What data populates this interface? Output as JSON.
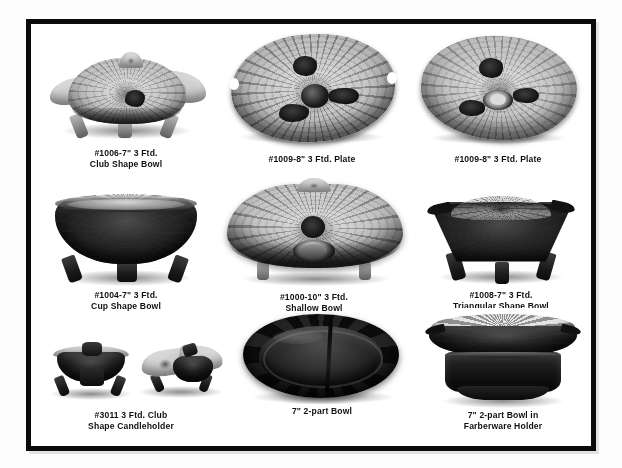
{
  "page": {
    "background_color": "#ffffff",
    "border_color": "#0b0b0b",
    "media": "grayscale-photograph-catalog-page"
  },
  "items": [
    {
      "id": "item-1006",
      "row": 1,
      "col": 1,
      "caption_line_1": "#1006-7\" 3 Ftd.",
      "caption_line_2": "Club Shape Bowl",
      "photo_description": "clear leaf-pattern three-footed club shape bowl, light gray glass",
      "tone": "light",
      "shape": "club"
    },
    {
      "id": "item-1009-a",
      "row": 1,
      "col": 2,
      "caption_line_1": "#1009-8\" 3 Ftd. Plate",
      "caption_line_2": "",
      "photo_description": "leaf-veined round plate viewed from above with dark center hub",
      "tone": "light",
      "shape": "plate"
    },
    {
      "id": "item-1009-b",
      "row": 1,
      "col": 3,
      "caption_line_1": "#1009-8\" 3 Ftd. Plate",
      "caption_line_2": "",
      "photo_description": "leaf-veined round plate viewed from above with ring foot at center",
      "tone": "light",
      "shape": "plate"
    },
    {
      "id": "item-1004",
      "row": 2,
      "col": 1,
      "caption_line_1": "#1004-7\" 3 Ftd.",
      "caption_line_2": "Cup Shape Bowl",
      "photo_description": "dark amethyst deep cup shape bowl with scalloped rim on three feet",
      "tone": "dark",
      "shape": "cup"
    },
    {
      "id": "item-1000",
      "row": 2,
      "col": 2,
      "caption_line_1": "#1000-10\" 3 Ftd.",
      "caption_line_2": "Shallow Bowl",
      "photo_description": "large shallow leaf-pattern bowl, light glass with dark center knob",
      "tone": "light",
      "shape": "shallow"
    },
    {
      "id": "item-1008",
      "row": 2,
      "col": 3,
      "caption_line_1": "#1008-7\" 3 Ftd.",
      "caption_line_2": "Triangular Shape Bowl",
      "photo_description": "dark triangular shape footed bowl with light leaf-pattern interior",
      "tone": "dark",
      "shape": "triangular"
    },
    {
      "id": "item-3011",
      "row": 3,
      "col": 1,
      "caption_line_1": "#3011 3 Ftd. Club",
      "caption_line_2": "Shape Candleholder",
      "photo_description": "pair of three-footed club shape candleholders, front view and angled view",
      "tone": "dark",
      "shape": "candleholder-pair"
    },
    {
      "id": "item-2part",
      "row": 3,
      "col": 2,
      "caption_line_1": "7\" 2-part Bowl",
      "caption_line_2": "",
      "photo_description": "dark two-part divided bowl seen from above with center divider",
      "tone": "dark",
      "shape": "divided"
    },
    {
      "id": "item-2part-holder",
      "row": 3,
      "col": 3,
      "caption_line_1": "7\" 2-part Bowl in",
      "caption_line_2": "Farberware Holder",
      "photo_description": "two-part bowl seated in a dark metal Farberware pedestal holder",
      "tone": "dark",
      "shape": "holder"
    }
  ]
}
